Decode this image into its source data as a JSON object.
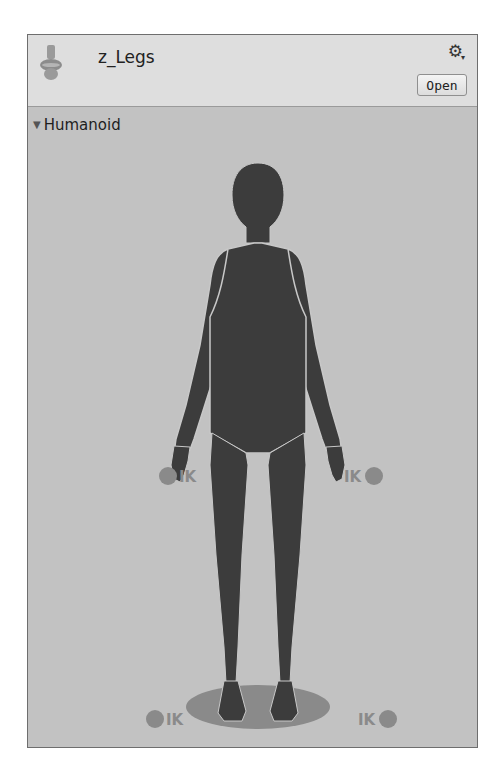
{
  "header": {
    "asset_name": "z_Legs",
    "asset_icon": "avatar-mask-icon",
    "settings_icon": "gear-icon",
    "open_button_label": "Open"
  },
  "body": {
    "foldout_label": "Humanoid",
    "foldout_state": "expanded",
    "figure": "humanoid-body-mask",
    "ik_labels": {
      "left_hand": "IK",
      "right_hand": "IK",
      "left_foot": "IK",
      "right_foot": "IK"
    }
  },
  "colors": {
    "panel_bg": "#c2c2c2",
    "header_bg": "#dedede",
    "body_active": "#3c3c3c",
    "body_inactive": "#8a8a8a",
    "outline": "#c8c8c8"
  }
}
